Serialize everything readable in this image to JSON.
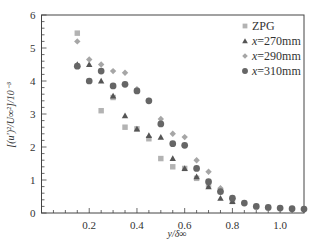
{
  "chart_data": {
    "type": "scatter",
    "title": "",
    "xlabel": "y/δ∞",
    "ylabel": "[(u')²/U∞²]/10⁻³",
    "xlim": [
      0.0,
      1.1
    ],
    "ylim": [
      0,
      6
    ],
    "x_ticks": [
      0.2,
      0.4,
      0.6,
      0.8,
      1.0
    ],
    "x_tick_labels": [
      "0.2",
      "0.4",
      "0.6",
      "0.8",
      "1.0"
    ],
    "y_ticks": [
      0,
      1,
      2,
      3,
      4,
      5,
      6
    ],
    "y_tick_labels": [
      "0",
      "1",
      "2",
      "3",
      "4",
      "5",
      "6"
    ],
    "grid": false,
    "legend_position": "upper right",
    "series": [
      {
        "name": "ZPG",
        "marker": "square",
        "color": "#b3b3b3",
        "x": [
          0.15,
          0.25,
          0.3,
          0.35,
          0.4,
          0.45,
          0.5,
          0.55,
          0.6,
          0.65,
          0.7,
          0.75,
          0.8
        ],
        "y": [
          5.45,
          3.1,
          3.5,
          2.6,
          2.55,
          2.25,
          1.65,
          1.4,
          1.35,
          1.05,
          0.85,
          0.65,
          0.35
        ]
      },
      {
        "name": "x=270mm",
        "marker": "triangle",
        "color": "#555555",
        "x": [
          0.15,
          0.2,
          0.25,
          0.3,
          0.35,
          0.4,
          0.45,
          0.5,
          0.55,
          0.6,
          0.65,
          0.7,
          0.75,
          0.8
        ],
        "y": [
          4.5,
          4.5,
          4.0,
          3.55,
          2.95,
          2.55,
          2.35,
          2.3,
          1.65,
          1.35,
          1.1,
          0.8,
          0.45,
          0.35
        ]
      },
      {
        "name": "x=290mm",
        "marker": "diamond",
        "color": "#a6a6a6",
        "x": [
          0.15,
          0.2,
          0.25,
          0.3,
          0.35,
          0.4,
          0.45,
          0.5,
          0.55,
          0.6,
          0.65,
          0.7,
          0.75,
          0.8
        ],
        "y": [
          5.2,
          4.65,
          4.5,
          4.3,
          4.25,
          3.75,
          3.4,
          2.85,
          2.4,
          2.3,
          1.6,
          1.25,
          0.75,
          0.45
        ]
      },
      {
        "name": "x=310mm",
        "marker": "circle",
        "color": "#666666",
        "x": [
          0.15,
          0.2,
          0.25,
          0.3,
          0.35,
          0.4,
          0.45,
          0.5,
          0.55,
          0.6,
          0.65,
          0.7,
          0.75,
          0.8,
          0.85,
          0.9,
          0.95,
          1.0,
          1.05,
          1.1
        ],
        "y": [
          4.45,
          4.0,
          4.3,
          3.85,
          3.9,
          3.7,
          3.4,
          2.7,
          2.1,
          2.05,
          1.35,
          0.95,
          0.65,
          0.45,
          0.3,
          0.2,
          0.17,
          0.15,
          0.13,
          0.12
        ]
      }
    ]
  },
  "legend": {
    "items": [
      {
        "label_prefix": "",
        "label": "ZPG"
      },
      {
        "label_prefix": "x",
        "label": "=270mm"
      },
      {
        "label_prefix": "x",
        "label": "=290mm"
      },
      {
        "label_prefix": "x",
        "label": "=310mm"
      }
    ]
  },
  "axes": {
    "xlabel": "y/δ∞",
    "ylabel": "[(u')²/U∞²]/10⁻³"
  }
}
